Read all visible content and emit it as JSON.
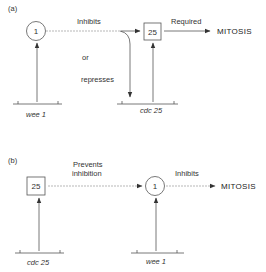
{
  "panel_a": {
    "label": "(a)",
    "wee1_node": "1",
    "cdc25_node": "25",
    "inhibits_label": "Inhibits",
    "or_label": "or",
    "represses_label": "represses",
    "required_label": "Required",
    "mitosis_label": "MITOSIS",
    "wee1_gene_label": "wee 1",
    "cdc25_gene_label": "cdc 25"
  },
  "panel_b": {
    "label": "(b)",
    "cdc25_node": "25",
    "wee1_node": "1",
    "prevents_label_line1": "Prevents",
    "prevents_label_line2": "inhibition",
    "inhibits_label": "Inhibits",
    "mitosis_label": "MITOSIS",
    "cdc25_gene_label": "cdc 25",
    "wee1_gene_label": "wee 1"
  }
}
